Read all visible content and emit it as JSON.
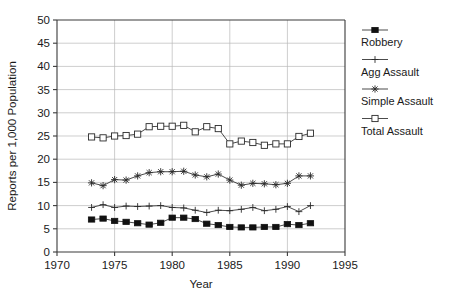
{
  "chart_data": {
    "type": "line",
    "title": "",
    "xlabel": "Year",
    "ylabel": "Reports per 1,000 Population",
    "xlim": [
      1970,
      1995
    ],
    "ylim": [
      0,
      50
    ],
    "xticks": [
      1970,
      1975,
      1980,
      1985,
      1990,
      1995
    ],
    "yticks": [
      0,
      5,
      10,
      15,
      20,
      25,
      30,
      35,
      40,
      45,
      50
    ],
    "grid": true,
    "legend_position": "right",
    "x": [
      1973,
      1974,
      1975,
      1976,
      1977,
      1978,
      1979,
      1980,
      1981,
      1982,
      1983,
      1984,
      1985,
      1986,
      1987,
      1988,
      1989,
      1990,
      1991,
      1992
    ],
    "series": [
      {
        "name": "Robbery",
        "marker": "filled-square",
        "values": [
          7.0,
          7.2,
          6.7,
          6.5,
          6.2,
          5.9,
          6.3,
          7.4,
          7.4,
          7.1,
          6.1,
          5.8,
          5.4,
          5.3,
          5.3,
          5.4,
          5.4,
          6.0,
          5.8,
          6.2
        ]
      },
      {
        "name": "Agg Assault",
        "marker": "plus",
        "values": [
          9.6,
          10.2,
          9.6,
          9.9,
          9.8,
          9.9,
          10.0,
          9.6,
          9.5,
          9.0,
          8.5,
          9.0,
          8.9,
          9.2,
          9.6,
          8.9,
          9.2,
          9.8,
          8.7,
          10.0
        ]
      },
      {
        "name": "Simple Assault",
        "marker": "asterisk",
        "values": [
          14.9,
          14.3,
          15.6,
          15.5,
          16.4,
          17.1,
          17.3,
          17.3,
          17.4,
          16.6,
          16.2,
          16.8,
          15.5,
          14.4,
          14.8,
          14.7,
          14.5,
          14.8,
          16.4,
          16.4
        ]
      },
      {
        "name": "Total Assault",
        "marker": "open-square",
        "values": [
          24.8,
          24.6,
          25.0,
          25.1,
          25.4,
          27.0,
          27.1,
          27.1,
          27.3,
          25.9,
          27.0,
          26.6,
          23.3,
          23.9,
          23.6,
          23.0,
          23.3,
          23.3,
          24.9,
          25.6
        ]
      }
    ]
  },
  "legend": {
    "items": [
      {
        "label": "Robbery",
        "marker": "filled-square"
      },
      {
        "label": "Agg Assault",
        "marker": "plus"
      },
      {
        "label": "Simple Assault",
        "marker": "asterisk"
      },
      {
        "label": "Total Assault",
        "marker": "open-square"
      }
    ]
  },
  "axes": {
    "y_title": "Reports per 1,000 Population",
    "x_title": "Year",
    "y_tick_labels": [
      "50",
      "45",
      "40",
      "35",
      "30",
      "25",
      "20",
      "15",
      "10",
      "5",
      "0"
    ],
    "x_tick_labels": [
      "1970",
      "1975",
      "1980",
      "1985",
      "1990",
      "1995"
    ]
  }
}
